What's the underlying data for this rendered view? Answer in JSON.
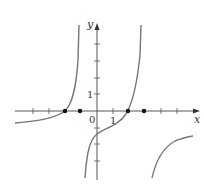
{
  "figure": {
    "axes": {
      "x_label": "x",
      "y_label": "y",
      "origin_label": "0",
      "x_unit_label": "1",
      "y_unit_label": "1"
    },
    "colors": {
      "axis": "#555555",
      "curve": "#777777",
      "point": "#111111"
    },
    "points_on_x_axis": [
      -2,
      -1,
      2,
      3
    ],
    "curve_description": "Graph of a function with vertical asymptotes near x = -1.1 and x = 2.8, passing through zeros near x = -2 and x = 2, y-intercept near -1.2"
  }
}
